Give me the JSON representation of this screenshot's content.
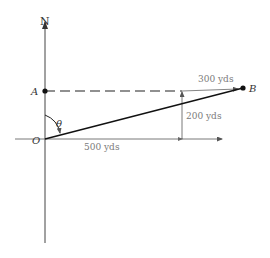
{
  "diagram": {
    "north_label": "N",
    "points": {
      "A": "A",
      "B": "B",
      "O": "O"
    },
    "angle_label": "θ",
    "measurements": {
      "east": "500 yds",
      "north": "200 yds",
      "ab": "300 yds"
    },
    "colors": {
      "line": "#1a1a1a",
      "text": "#333333",
      "measure_text": "#7a7a7a"
    }
  }
}
